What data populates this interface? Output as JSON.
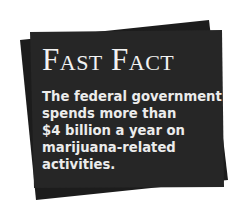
{
  "card": {
    "title": "Fast Fact",
    "lines": [
      "The federal government",
      "spends more than",
      "$4 billion a year on",
      "marijuana-related",
      "activities."
    ],
    "colors": {
      "back_card": "#1c1c1c",
      "front_card": "#242424",
      "text": "#f0f0f0"
    }
  }
}
